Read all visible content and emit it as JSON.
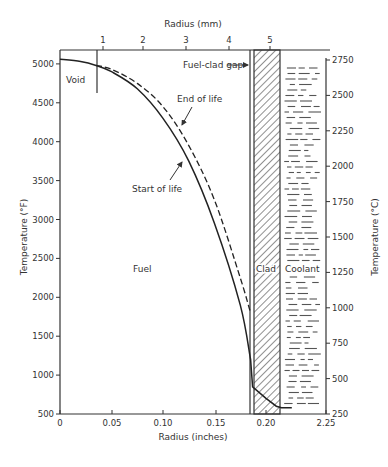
{
  "chart_data": {
    "type": "line",
    "title": "",
    "xlabel": "Radius (inches)",
    "xlabel_top": "Radius (mm)",
    "ylabel": "Temperature (°F)",
    "ylabel_right": "Temperature (°C)",
    "xlim": [
      0,
      0.225
    ],
    "ylim": [
      500,
      5200
    ],
    "ylim_right": [
      250,
      2750
    ],
    "x_ticks": [
      "0",
      "0.05",
      "0.10",
      "0.15",
      "0.20",
      "2.25"
    ],
    "x_ticks_top": [
      "1",
      "2",
      "3",
      "4",
      "5"
    ],
    "y_ticks": [
      "500",
      "1000",
      "1500",
      "2000",
      "2500",
      "3000",
      "3500",
      "4000",
      "4500",
      "5000"
    ],
    "y_ticks_right": [
      "250",
      "500",
      "750",
      "1000",
      "1250",
      "1500",
      "1750",
      "2000",
      "2250",
      "2500",
      "2750"
    ],
    "regions": [
      "Void",
      "Fuel",
      "Fuel-clad gap",
      "Clad",
      "Coolant"
    ],
    "series": [
      {
        "name": "Start of life",
        "style": "solid",
        "x": [
          0.0,
          0.02,
          0.035,
          0.05,
          0.075,
          0.1,
          0.125,
          0.15,
          0.175,
          0.185,
          0.187,
          0.2,
          0.21,
          0.215,
          0.225
        ],
        "y": [
          5060,
          5030,
          4980,
          4900,
          4680,
          4300,
          3750,
          2950,
          1900,
          1200,
          850,
          700,
          600,
          580,
          580
        ]
      },
      {
        "name": "End of life",
        "style": "dashed",
        "x": [
          0.035,
          0.05,
          0.075,
          0.1,
          0.125,
          0.15,
          0.175,
          0.185
        ],
        "y": [
          4980,
          4930,
          4750,
          4450,
          3950,
          3250,
          2250,
          1800
        ]
      }
    ],
    "annotations": [
      {
        "text": "Void",
        "x": 0.01,
        "y": 4850
      },
      {
        "text": "Fuel",
        "x": 0.08,
        "y": 2250
      },
      {
        "text": "Fuel-clad gap",
        "x": 0.17,
        "y": 5000,
        "arrow": true
      },
      {
        "text": "End of life",
        "x": 0.155,
        "y": 4500,
        "arrow": true
      },
      {
        "text": "Start of life",
        "x": 0.1,
        "y": 3600,
        "arrow": true
      },
      {
        "text": "Clad",
        "x": 0.195,
        "y": 2300
      },
      {
        "text": "Coolant",
        "x": 0.215,
        "y": 2300
      }
    ],
    "grid": false,
    "legend": "none"
  },
  "labels": {
    "radius_mm": "Radius (mm)",
    "radius_in": "Radius (inches)",
    "temp_f": "Temperature (°F)",
    "temp_c": "Temperature (°C)",
    "void": "Void",
    "fuel": "Fuel",
    "gap": "Fuel-clad gap",
    "eol": "End of life",
    "sol": "Start of life",
    "clad": "Clad",
    "coolant": "Coolant"
  }
}
